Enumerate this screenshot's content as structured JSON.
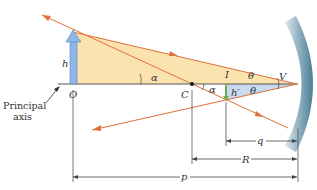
{
  "diagram": {
    "type": "concave mirror ray diagram",
    "colors": {
      "object_triangle": "#fbe3b0",
      "image_triangle": "#c9d9ee",
      "ray": "#e0703a",
      "object_arrow": "#8fb6e6",
      "image_arrow": "#6ab04c",
      "mirror": "#7fa5b8",
      "axis": "#555555",
      "dimension": "#444444"
    },
    "labels": {
      "object_height": "h",
      "object_point": "O",
      "center": "C",
      "image_top": "I",
      "image_height": "h′",
      "vertex": "V",
      "alpha_1": "α",
      "alpha_2": "α",
      "theta_1": "θ",
      "theta_2": "θ",
      "principal_axis_line1": "Principal",
      "principal_axis_line2": "axis",
      "image_distance": "q",
      "radius": "R",
      "object_distance": "p"
    }
  }
}
